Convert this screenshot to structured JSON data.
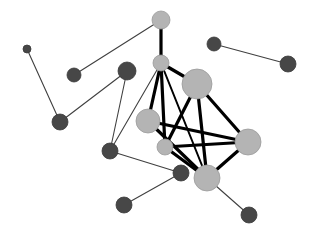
{
  "diagram": {
    "type": "network-graph",
    "colors": {
      "background": "#ffffff",
      "light_node": "#b4b4b4",
      "light_node_stroke": "#9a9a9a",
      "dark_node": "#474747",
      "dark_node_stroke": "#3a3a3a",
      "thick_edge": "#000000",
      "thin_edge": "#404040"
    },
    "nodes": [
      {
        "id": "A",
        "x": 161,
        "y": 20,
        "r": 9,
        "kind": "light"
      },
      {
        "id": "B",
        "x": 161,
        "y": 63,
        "r": 8,
        "kind": "light"
      },
      {
        "id": "C",
        "x": 197,
        "y": 84,
        "r": 15,
        "kind": "light"
      },
      {
        "id": "D",
        "x": 148,
        "y": 121,
        "r": 12,
        "kind": "light"
      },
      {
        "id": "E",
        "x": 165,
        "y": 147,
        "r": 8,
        "kind": "light"
      },
      {
        "id": "F",
        "x": 248,
        "y": 142,
        "r": 13,
        "kind": "light"
      },
      {
        "id": "G",
        "x": 207,
        "y": 178,
        "r": 13,
        "kind": "light"
      },
      {
        "id": "d1",
        "x": 27,
        "y": 49,
        "r": 4,
        "kind": "dark"
      },
      {
        "id": "d2",
        "x": 74,
        "y": 75,
        "r": 7,
        "kind": "dark"
      },
      {
        "id": "d3",
        "x": 127,
        "y": 71,
        "r": 9,
        "kind": "dark"
      },
      {
        "id": "d4",
        "x": 60,
        "y": 122,
        "r": 8,
        "kind": "dark"
      },
      {
        "id": "d5",
        "x": 110,
        "y": 151,
        "r": 8,
        "kind": "dark"
      },
      {
        "id": "d6",
        "x": 181,
        "y": 173,
        "r": 8,
        "kind": "dark"
      },
      {
        "id": "d7",
        "x": 124,
        "y": 205,
        "r": 8,
        "kind": "dark"
      },
      {
        "id": "d8",
        "x": 249,
        "y": 215,
        "r": 8,
        "kind": "dark"
      },
      {
        "id": "d9",
        "x": 214,
        "y": 44,
        "r": 7,
        "kind": "dark"
      },
      {
        "id": "d10",
        "x": 288,
        "y": 64,
        "r": 8,
        "kind": "dark"
      }
    ],
    "edges": [
      {
        "from": "A",
        "to": "B",
        "weight": "thick"
      },
      {
        "from": "B",
        "to": "C",
        "weight": "thick"
      },
      {
        "from": "B",
        "to": "D",
        "weight": "thick"
      },
      {
        "from": "B",
        "to": "E",
        "weight": "thick"
      },
      {
        "from": "B",
        "to": "G",
        "weight": "medium"
      },
      {
        "from": "C",
        "to": "F",
        "weight": "thick"
      },
      {
        "from": "C",
        "to": "E",
        "weight": "thick"
      },
      {
        "from": "C",
        "to": "G",
        "weight": "thick"
      },
      {
        "from": "D",
        "to": "F",
        "weight": "thick"
      },
      {
        "from": "D",
        "to": "G",
        "weight": "thick"
      },
      {
        "from": "E",
        "to": "F",
        "weight": "thick"
      },
      {
        "from": "E",
        "to": "G",
        "weight": "thick"
      },
      {
        "from": "F",
        "to": "G",
        "weight": "thick"
      },
      {
        "from": "A",
        "to": "d2",
        "weight": "thin"
      },
      {
        "from": "d1",
        "to": "d4",
        "weight": "thin"
      },
      {
        "from": "d4",
        "to": "d3",
        "weight": "thin"
      },
      {
        "from": "d3",
        "to": "d5",
        "weight": "thin"
      },
      {
        "from": "B",
        "to": "d5",
        "weight": "thin"
      },
      {
        "from": "d5",
        "to": "d6",
        "weight": "thin"
      },
      {
        "from": "d6",
        "to": "d7",
        "weight": "thin"
      },
      {
        "from": "G",
        "to": "d8",
        "weight": "thin"
      },
      {
        "from": "d9",
        "to": "d10",
        "weight": "thin"
      }
    ]
  }
}
